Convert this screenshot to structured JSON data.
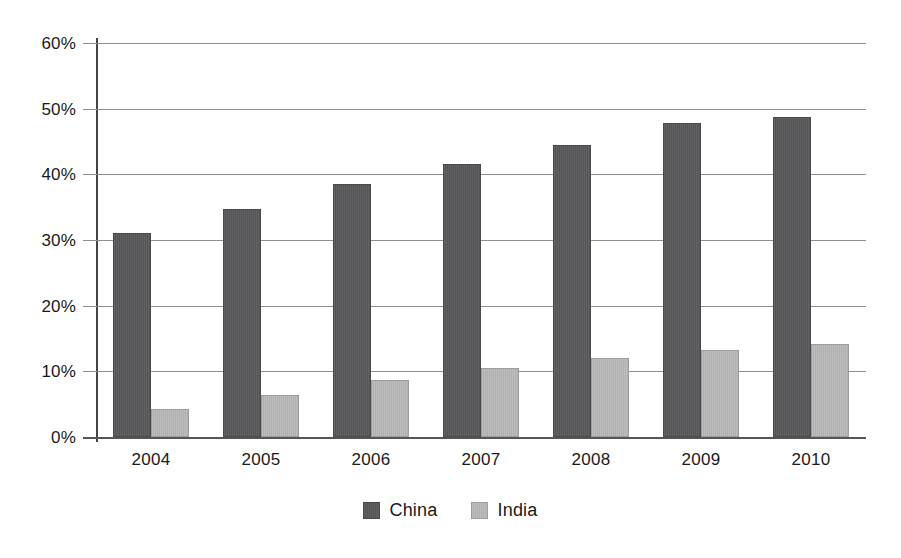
{
  "chart_data": {
    "type": "bar",
    "title": "",
    "subtitle": "",
    "xlabel": "",
    "ylabel": "",
    "categories": [
      "2004",
      "2005",
      "2006",
      "2007",
      "2008",
      "2009",
      "2010"
    ],
    "series": [
      {
        "name": "China",
        "color": "#59595b",
        "values": [
          31.1,
          34.7,
          38.5,
          41.6,
          44.4,
          47.8,
          48.8
        ]
      },
      {
        "name": "India",
        "color": "#b6b6b6",
        "values": [
          4.3,
          6.4,
          8.7,
          10.5,
          12.0,
          13.3,
          14.1
        ]
      }
    ],
    "ylim": [
      0,
      60
    ],
    "ytick_values": [
      0,
      10,
      20,
      30,
      40,
      50,
      60
    ],
    "ytick_labels": [
      "0%",
      "10%",
      "20%",
      "30%",
      "40%",
      "50%",
      "60%"
    ],
    "grid": true,
    "grid_axis": "y",
    "legend_position": "bottom-center",
    "value_unit": "%"
  },
  "axes": {
    "grid_color": "#8e8e8e",
    "axis_color": "#555555"
  },
  "legend": {
    "entries": [
      {
        "label": "China"
      },
      {
        "label": "India"
      }
    ]
  }
}
